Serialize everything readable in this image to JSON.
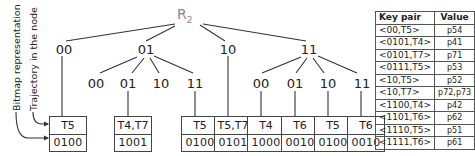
{
  "root": {
    "label": "R",
    "sub": "2"
  },
  "level1": [
    {
      "label": "00"
    },
    {
      "label": "01"
    },
    {
      "label": "10"
    },
    {
      "label": "11"
    }
  ],
  "level2_under_01": [
    {
      "label": "00"
    },
    {
      "label": "01"
    },
    {
      "label": "10"
    },
    {
      "label": "11"
    }
  ],
  "level2_under_11": [
    {
      "label": "00"
    },
    {
      "label": "01"
    },
    {
      "label": "10"
    },
    {
      "label": "11"
    }
  ],
  "leaves": [
    {
      "traj": "T5",
      "bitmap": "0100"
    },
    {
      "traj": "T4,T7",
      "bitmap": "1001"
    },
    {
      "traj": "T5",
      "bitmap": "0100"
    },
    {
      "traj": "T5,T7",
      "bitmap": "0101"
    },
    {
      "traj": "T4",
      "bitmap": "1000"
    },
    {
      "traj": "T6",
      "bitmap": "0010"
    },
    {
      "traj": "T5",
      "bitmap": "0100"
    },
    {
      "traj": "T6",
      "bitmap": "0010"
    }
  ],
  "annotations": {
    "bitmap": "Bitmap representation",
    "trajectory": "Trajectory in the node"
  },
  "table": {
    "headers": [
      "Key pair",
      "Value"
    ],
    "rows": [
      {
        "key": "<00,T5>",
        "value": "p54"
      },
      {
        "key": "<0101,T4>",
        "value": "p41"
      },
      {
        "key": "<0101,T7>",
        "value": "p71"
      },
      {
        "key": "<0111,T5>",
        "value": "p53"
      },
      {
        "key": "<10,T5>",
        "value": "p52"
      },
      {
        "key": "<10,T7>",
        "value": "p72,p73"
      },
      {
        "key": "<1100,T4>",
        "value": "p42"
      },
      {
        "key": "<1101,T6>",
        "value": "p62"
      },
      {
        "key": "<1110,T5>",
        "value": "p51"
      },
      {
        "key": "<1111,T6>",
        "value": "p61"
      }
    ]
  }
}
